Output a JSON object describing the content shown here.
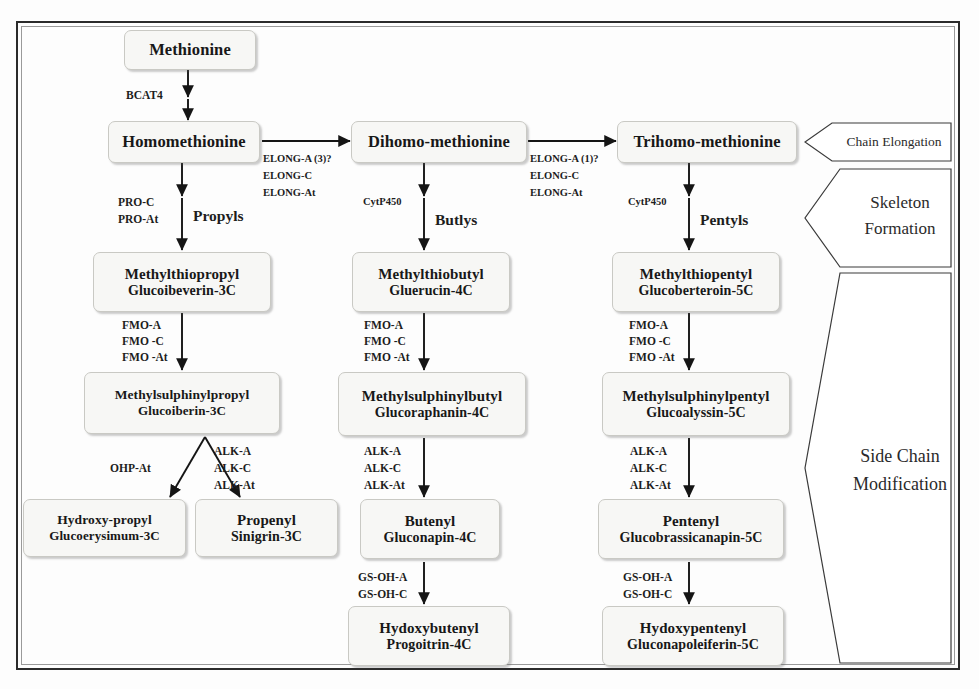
{
  "diagram": {
    "frame_color": "#2b2b2b",
    "node_fill": "#f7f7f5",
    "node_border": "#c9c9c4",
    "text_color": "#181818"
  },
  "nodes": {
    "methionine": {
      "line1": "Methionine",
      "line2": ""
    },
    "homomethionine": {
      "line1": "Homomethionine",
      "line2": ""
    },
    "dihomo_methionine": {
      "line1": "Dihomo-methionine",
      "line2": ""
    },
    "trihomo_methionine": {
      "line1": "Trihomo-methionine",
      "line2": ""
    },
    "methylthiopropyl": {
      "line1": "Methylthiopropyl",
      "line2": "Glucoibeverin-3C"
    },
    "methylthiobutyl": {
      "line1": "Methylthiobutyl",
      "line2": "Gluerucin-4C"
    },
    "methylthiopentyl": {
      "line1": "Methylthiopentyl",
      "line2": "Glucoberteroin-5C"
    },
    "methylsulphinylpropyl": {
      "line1": "Methylsulphinylpropyl",
      "line2": "Glucoiberin-3C"
    },
    "methylsulphinylbutyl": {
      "line1": "Methylsulphinylbutyl",
      "line2": "Glucoraphanin-4C"
    },
    "methylsulphinylpentyl": {
      "line1": "Methylsulphinylpentyl",
      "line2": "Glucoalyssin-5C"
    },
    "hydroxy_propyl": {
      "line1": "Hydroxy-propyl",
      "line2": "Glucoerysimum-3C"
    },
    "propenyl": {
      "line1": "Propenyl",
      "line2": "Sinigrin-3C"
    },
    "butenyl": {
      "line1": "Butenyl",
      "line2": "Gluconapin-4C"
    },
    "pentenyl": {
      "line1": "Pentenyl",
      "line2": "Glucobrassicanapin-5C"
    },
    "hydoxybutenyl": {
      "line1": "Hydoxybutenyl",
      "line2": "Progoitrin-4C"
    },
    "hydoxypentenyl": {
      "line1": "Hydoxypentenyl",
      "line2": "Gluconapoleiferin-5C"
    }
  },
  "enzymes": {
    "bcat4": "BCAT4",
    "elong_1_l1": "ELONG-A (3)?",
    "elong_1_l2": "ELONG-C",
    "elong_1_l3": "ELONG-At",
    "elong_2_l1": "ELONG-A (1)?",
    "elong_2_l2": "ELONG-C",
    "elong_2_l3": "ELONG-At",
    "pro_l1": "PRO-C",
    "pro_l2": "PRO-At",
    "cytp450_mid": "CytP450",
    "cytp450_right": "CytP450",
    "fmo_left_l1": "FMO-A",
    "fmo_left_l2": "FMO -C",
    "fmo_left_l3": "FMO -At",
    "fmo_mid_l1": "FMO-A",
    "fmo_mid_l2": "FMO -C",
    "fmo_mid_l3": "FMO -At",
    "fmo_right_l1": "FMO-A",
    "fmo_right_l2": "FMO -C",
    "fmo_right_l3": "FMO -At",
    "ohp_at": "OHP-At",
    "alk_left_l1": "ALK-A",
    "alk_left_l2": "ALK-C",
    "alk_left_l3": "ALK-At",
    "alk_mid_l1": "ALK-A",
    "alk_mid_l2": "ALK-C",
    "alk_mid_l3": "ALK-At",
    "alk_right_l1": "ALK-A",
    "alk_right_l2": "ALK-C",
    "alk_right_l3": "ALK-At",
    "gsoh_mid_l1": "GS-OH-A",
    "gsoh_mid_l2": "GS-OH-C",
    "gsoh_right_l1": "GS-OH-A",
    "gsoh_right_l2": "GS-OH-C"
  },
  "products": {
    "propyls": "Propyls",
    "butlys": "Butlys",
    "pentyls": "Pentyls"
  },
  "banners": {
    "chain_elongation": "Chain Elongation",
    "skeleton_formation_l1": "Skeleton",
    "skeleton_formation_l2": "Formation",
    "side_chain_modification_l1": "Side Chain",
    "side_chain_modification_l2": "Modification"
  }
}
